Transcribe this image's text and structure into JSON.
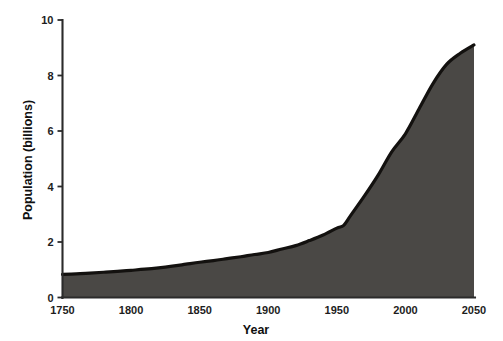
{
  "chart_data": {
    "type": "area",
    "title": "",
    "xlabel": "Year",
    "ylabel": "Population (billions)",
    "xlim": [
      1750,
      2050
    ],
    "ylim": [
      0,
      10
    ],
    "xticks": [
      1750,
      1800,
      1850,
      1900,
      1950,
      2000,
      2050
    ],
    "xtick_labels": [
      "1750",
      "1800",
      "1850",
      "1900",
      "1950",
      "2000",
      "2050"
    ],
    "yticks": [
      0,
      2,
      4,
      6,
      8,
      10
    ],
    "ytick_labels": [
      "0",
      "2",
      "4",
      "6",
      "8",
      "10"
    ],
    "grid": false,
    "legend": false,
    "series": [
      {
        "name": "World population",
        "fill_color": "#4a4845",
        "line_color": "#13110f",
        "x": [
          1750,
          1760,
          1770,
          1780,
          1790,
          1800,
          1810,
          1820,
          1830,
          1840,
          1850,
          1860,
          1870,
          1880,
          1890,
          1900,
          1910,
          1920,
          1930,
          1940,
          1950,
          1955,
          1960,
          1970,
          1980,
          1990,
          2000,
          2010,
          2020,
          2030,
          2040,
          2050
        ],
        "values": [
          0.83,
          0.85,
          0.88,
          0.91,
          0.94,
          0.98,
          1.02,
          1.07,
          1.13,
          1.2,
          1.27,
          1.33,
          1.4,
          1.47,
          1.55,
          1.62,
          1.75,
          1.87,
          2.05,
          2.25,
          2.5,
          2.6,
          2.95,
          3.65,
          4.4,
          5.25,
          5.9,
          6.8,
          7.7,
          8.4,
          8.8,
          9.1
        ]
      }
    ]
  },
  "axes": {
    "y_axis_title": "Population (billions)",
    "x_axis_title": "Year"
  },
  "colors": {
    "area_fill": "#4a4845",
    "curve_stroke": "#13110f",
    "axis": "#2b2b2b",
    "background": "#ffffff",
    "text": "#1d1d1d"
  }
}
